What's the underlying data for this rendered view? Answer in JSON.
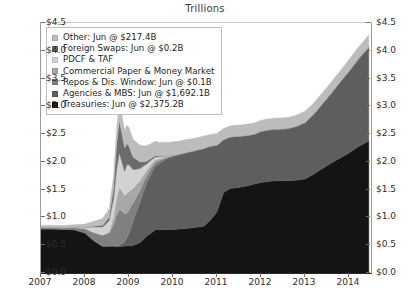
{
  "chart_data": {
    "type": "area",
    "title": "Trillions",
    "xlabel": "",
    "ylabel": "",
    "stacked": true,
    "grid": false,
    "legend_position": "top-left",
    "ylim": [
      0,
      4.5
    ],
    "xlim": [
      2007,
      2014.5
    ],
    "ytick_labels": [
      "$4.5",
      "$4.0",
      "$3.5",
      "$3.0",
      "$2.5",
      "$2.0",
      "$1.5",
      "$1.0",
      "$0.5",
      "$0.0"
    ],
    "ytick_values": [
      4.5,
      4.0,
      3.5,
      3.0,
      2.5,
      2.0,
      1.5,
      1.0,
      0.5,
      0.0
    ],
    "xtick_labels": [
      "2007",
      "2008",
      "2009",
      "2010",
      "2011",
      "2012",
      "2013",
      "2014"
    ],
    "xtick_values": [
      2007,
      2008,
      2009,
      2010,
      2011,
      2012,
      2013,
      2014
    ],
    "x": [
      2007.0,
      2007.25,
      2007.5,
      2007.75,
      2008.0,
      2008.2,
      2008.4,
      2008.55,
      2008.65,
      2008.72,
      2008.78,
      2008.85,
      2008.9,
      2008.95,
      2009.0,
      2009.05,
      2009.1,
      2009.18,
      2009.25,
      2009.32,
      2009.4,
      2009.5,
      2009.6,
      2009.7,
      2009.8,
      2009.9,
      2010.0,
      2010.15,
      2010.3,
      2010.5,
      2010.7,
      2010.85,
      2011.0,
      2011.15,
      2011.3,
      2011.5,
      2011.7,
      2011.85,
      2012.0,
      2012.2,
      2012.4,
      2012.6,
      2012.8,
      2013.0,
      2013.2,
      2013.4,
      2013.6,
      2013.8,
      2014.0,
      2014.2,
      2014.45
    ],
    "series": [
      {
        "name": "Treasuries",
        "legend_label": "Treasuries: Jun @ $2,375.2B",
        "latest_value_b": 2375.2,
        "color": "#141414",
        "values": [
          0.79,
          0.79,
          0.785,
          0.78,
          0.72,
          0.58,
          0.48,
          0.48,
          0.48,
          0.47,
          0.47,
          0.48,
          0.48,
          0.49,
          0.49,
          0.49,
          0.5,
          0.52,
          0.55,
          0.6,
          0.66,
          0.72,
          0.78,
          0.78,
          0.78,
          0.78,
          0.78,
          0.79,
          0.8,
          0.82,
          0.84,
          0.95,
          1.1,
          1.45,
          1.52,
          1.54,
          1.57,
          1.6,
          1.63,
          1.65,
          1.66,
          1.66,
          1.67,
          1.69,
          1.78,
          1.88,
          1.98,
          2.07,
          2.16,
          2.27,
          2.375
        ]
      },
      {
        "name": "Agencies & MBS",
        "legend_label": "Agencies & MBS: Jun @ $1,692.1B",
        "latest_value_b": 1692.1,
        "color": "#5e5e5e",
        "values": [
          0.0,
          0.0,
          0.0,
          0.0,
          0.0,
          0.0,
          0.0,
          0.0,
          0.01,
          0.02,
          0.03,
          0.05,
          0.08,
          0.14,
          0.22,
          0.33,
          0.45,
          0.6,
          0.72,
          0.84,
          0.95,
          1.06,
          1.14,
          1.2,
          1.25,
          1.29,
          1.32,
          1.34,
          1.36,
          1.38,
          1.4,
          1.33,
          1.2,
          0.95,
          0.93,
          0.92,
          0.91,
          0.9,
          0.92,
          0.93,
          0.93,
          0.94,
          0.97,
          1.02,
          1.08,
          1.17,
          1.26,
          1.37,
          1.47,
          1.57,
          1.692
        ]
      },
      {
        "name": "Repos & Dis. Window",
        "legend_label": "Repos & Dis. Window: Jun @ $0.1B",
        "latest_value_b": 0.1,
        "color": "#808080",
        "values": [
          0.03,
          0.03,
          0.03,
          0.04,
          0.08,
          0.15,
          0.2,
          0.24,
          0.38,
          0.56,
          0.64,
          0.58,
          0.5,
          0.45,
          0.42,
          0.38,
          0.32,
          0.26,
          0.21,
          0.17,
          0.13,
          0.1,
          0.07,
          0.05,
          0.03,
          0.02,
          0.01,
          0.01,
          0.01,
          0.005,
          0.005,
          0.005,
          0.003,
          0.002,
          0.002,
          0.002,
          0.001,
          0.001,
          0.001,
          0.001,
          0.001,
          0.001,
          0.001,
          0.001,
          0.001,
          0.001,
          0.001,
          0.001,
          0.001,
          0.001,
          0.0001
        ]
      },
      {
        "name": "Commercial Paper & Money Market",
        "legend_label": "Commercial Paper & Money Market",
        "latest_value_b": 0,
        "color": "#a8a8a8",
        "values": [
          0.0,
          0.0,
          0.0,
          0.0,
          0.0,
          0.0,
          0.0,
          0.02,
          0.14,
          0.3,
          0.4,
          0.36,
          0.33,
          0.35,
          0.34,
          0.3,
          0.26,
          0.22,
          0.18,
          0.14,
          0.1,
          0.07,
          0.05,
          0.03,
          0.02,
          0.01,
          0.005,
          0.002,
          0.001,
          0.0,
          0.0,
          0.0,
          0.0,
          0.0,
          0.0,
          0.0,
          0.0,
          0.0,
          0.0,
          0.0,
          0.0,
          0.0,
          0.0,
          0.0,
          0.0,
          0.0,
          0.0,
          0.0,
          0.0,
          0.0,
          0.0
        ]
      },
      {
        "name": "PDCF & TAF",
        "legend_label": "PDCF & TAF",
        "latest_value_b": 0,
        "color": "#d2d2d2",
        "values": [
          0.0,
          0.0,
          0.0,
          0.0,
          0.02,
          0.1,
          0.15,
          0.2,
          0.33,
          0.52,
          0.62,
          0.5,
          0.44,
          0.52,
          0.48,
          0.4,
          0.33,
          0.27,
          0.22,
          0.17,
          0.12,
          0.08,
          0.05,
          0.03,
          0.02,
          0.01,
          0.005,
          0.002,
          0.0,
          0.0,
          0.0,
          0.0,
          0.0,
          0.0,
          0.0,
          0.0,
          0.0,
          0.0,
          0.0,
          0.0,
          0.0,
          0.0,
          0.0,
          0.0,
          0.0,
          0.0,
          0.0,
          0.0,
          0.0,
          0.0,
          0.0
        ]
      },
      {
        "name": "Foreign Swaps",
        "legend_label": "Foreign Swaps: Jun @ $0.2B",
        "latest_value_b": 0.2,
        "color": "#6b6b6b",
        "values": [
          0.0,
          0.0,
          0.0,
          0.0,
          0.0,
          0.01,
          0.03,
          0.06,
          0.2,
          0.45,
          0.58,
          0.5,
          0.42,
          0.38,
          0.33,
          0.27,
          0.22,
          0.17,
          0.12,
          0.08,
          0.05,
          0.03,
          0.02,
          0.01,
          0.005,
          0.002,
          0.001,
          0.0,
          0.0,
          0.0,
          0.0,
          0.0,
          0.0,
          0.0,
          0.0,
          0.0,
          0.0,
          0.0,
          0.0,
          0.0,
          0.0,
          0.0,
          0.0,
          0.0,
          0.0,
          0.0,
          0.0,
          0.0,
          0.0,
          0.0,
          0.0
        ]
      },
      {
        "name": "Other",
        "legend_label": "Other: Jun @ $217.4B",
        "latest_value_b": 217.4,
        "color": "#bcbcbc",
        "values": [
          0.04,
          0.04,
          0.04,
          0.05,
          0.06,
          0.09,
          0.12,
          0.16,
          0.22,
          0.3,
          0.34,
          0.33,
          0.32,
          0.33,
          0.34,
          0.33,
          0.32,
          0.31,
          0.3,
          0.29,
          0.28,
          0.27,
          0.26,
          0.25,
          0.25,
          0.24,
          0.24,
          0.23,
          0.23,
          0.22,
          0.22,
          0.21,
          0.21,
          0.2,
          0.2,
          0.2,
          0.2,
          0.2,
          0.2,
          0.2,
          0.2,
          0.2,
          0.2,
          0.2,
          0.2,
          0.2,
          0.2,
          0.2,
          0.21,
          0.21,
          0.217
        ]
      }
    ]
  },
  "legend": {
    "items": [
      {
        "label": "Other: Jun @ $217.4B",
        "color": "#bcbcbc",
        "icon": "legend-swatch-other"
      },
      {
        "label": "Foreign Swaps: Jun @ $0.2B",
        "color": "#6b6b6b",
        "icon": "legend-swatch-foreign-swaps"
      },
      {
        "label": "PDCF & TAF",
        "color": "#d2d2d2",
        "icon": "legend-swatch-pdcf-taf"
      },
      {
        "label": "Commercial Paper & Money Market",
        "color": "#a8a8a8",
        "icon": "legend-swatch-commercial-paper"
      },
      {
        "label": "Repos & Dis. Window: Jun @ $0.1B",
        "color": "#808080",
        "icon": "legend-swatch-repos"
      },
      {
        "label": "Agencies & MBS: Jun @ $1,692.1B",
        "color": "#5e5e5e",
        "icon": "legend-swatch-agencies-mbs"
      },
      {
        "label": "Treasuries: Jun @ $2,375.2B",
        "color": "#141414",
        "icon": "legend-swatch-treasuries"
      }
    ]
  }
}
